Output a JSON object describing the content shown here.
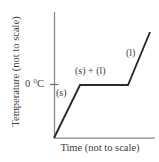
{
  "chart_data": {
    "type": "line",
    "title": "",
    "xlabel": "Time (not to scale)",
    "ylabel": "Temperature (not to scale)",
    "grid": false,
    "legend": "none",
    "axes": {
      "x_origin_px": 54,
      "x_end_px": 155,
      "y_top_px": 12,
      "y_bottom_px": 138
    },
    "ytick_labels": [
      "0 °C"
    ],
    "ytick_values": [
      0
    ],
    "xtick_labels": [],
    "series": [
      {
        "name": "heating curve",
        "points": [
          {
            "x": 0,
            "y": -40,
            "px": 54,
            "py": 138
          },
          {
            "x": 26,
            "y": 0,
            "px": 80,
            "py": 85
          },
          {
            "x": 74,
            "y": 0,
            "px": 128,
            "py": 85
          },
          {
            "x": 96,
            "y": 40,
            "px": 150,
            "py": 32
          }
        ],
        "color": "#2b2b2b"
      }
    ],
    "annotations": [
      {
        "text": "(s)",
        "region": "solid-phase-ramp"
      },
      {
        "text": "(s) + (l)",
        "region": "melting-plateau"
      },
      {
        "text": "(l)",
        "region": "liquid-phase-ramp"
      }
    ],
    "colors": {
      "axis": "#8a8a8a",
      "curve": "#2b2b2b",
      "text": "#3d3d3d",
      "background": "#ffffff"
    }
  },
  "axes": {
    "ylabel": "Temperature (not to scale)",
    "xlabel": "Time (not to scale)",
    "ytick_0c": "0 °C"
  },
  "labels": {
    "solid": "(s)",
    "solid_liquid": "(s) + (l)",
    "liquid": "(l)"
  }
}
